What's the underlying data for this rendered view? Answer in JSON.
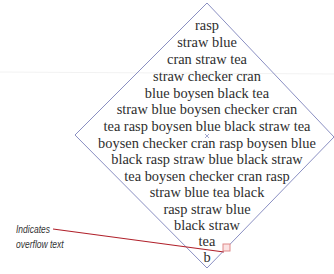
{
  "diagram": {
    "shape": "diamond",
    "stroke_color": "#8a8fc2",
    "text_color": "#2e2e2e",
    "lines": [
      "rasp",
      "straw blue",
      "cran straw tea",
      "straw checker cran",
      "blue boysen black tea",
      "straw blue boysen checker cran",
      "tea rasp boysen blue black straw tea",
      "boysen checker cran rasp boysen blue",
      "black rasp straw blue black straw",
      "tea boysen checker cran rasp",
      "straw blue tea black",
      "rasp straw blue",
      "black straw",
      "tea",
      "b"
    ],
    "overflow_marker_color": "#e08a8a"
  },
  "callout": {
    "line1": "Indicates",
    "line2": "overflow text",
    "leader_color": "#b0202a"
  }
}
